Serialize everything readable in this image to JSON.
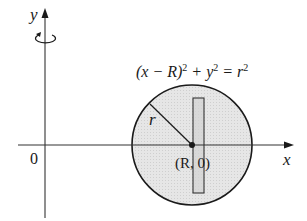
{
  "figure": {
    "type": "torus-generating-circle",
    "axes": {
      "x_label": "x",
      "y_label": "y",
      "origin_label": "0"
    },
    "rotation_indicator": "rotation-about-y-axis",
    "equation": {
      "lhs_1": "(x − R)",
      "exp_1": "2",
      "plus": " + y",
      "exp_2": "2",
      "eq": " = r",
      "exp_3": "2",
      "full": "(x − R)² + y² = r²"
    },
    "radius_label": "r",
    "center_label": "(R, 0)",
    "colors": {
      "circle_fill": "#e4e4e4",
      "strip_fill": "#cfcfcf",
      "stroke": "#1a1a1a",
      "axis": "#333333"
    }
  }
}
